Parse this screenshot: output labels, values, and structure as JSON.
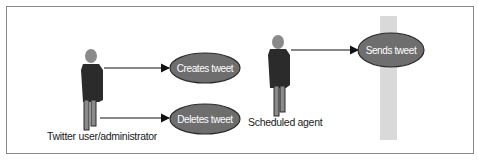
{
  "diagram": {
    "type": "use-case",
    "actors": [
      {
        "id": "twitter-user",
        "label": "Twitter user/administrator"
      },
      {
        "id": "scheduled-agent",
        "label": "Scheduled agent"
      }
    ],
    "use_cases": [
      {
        "id": "creates-tweet",
        "label": "Creates tweet"
      },
      {
        "id": "deletes-tweet",
        "label": "Deletes tweet"
      },
      {
        "id": "sends-tweet",
        "label": "Sends tweet"
      }
    ],
    "edges": [
      {
        "from": "twitter-user",
        "to": "creates-tweet"
      },
      {
        "from": "twitter-user",
        "to": "deletes-tweet"
      },
      {
        "from": "scheduled-agent",
        "to": "sends-tweet"
      }
    ],
    "colors": {
      "ellipse_fill": "#6e6e6e",
      "ellipse_stroke": "#2a2a2a",
      "actor_body": "#2b2b2b",
      "actor_head": "#8a8a8a",
      "boundary_bar": "#d9d9d9",
      "frame": "#8a8a8a"
    }
  }
}
